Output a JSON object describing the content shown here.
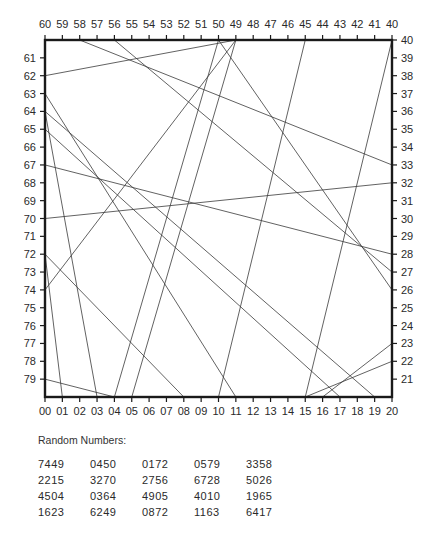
{
  "figure": {
    "frame": {
      "x0": 45,
      "y0": 40,
      "x1": 392,
      "y1": 397
    },
    "colors": {
      "frame": "#1a1a1a",
      "segments": "#3a3a3a",
      "text": "#2a2a2a"
    },
    "top_labels": [
      "60",
      "59",
      "58",
      "57",
      "56",
      "55",
      "54",
      "53",
      "52",
      "51",
      "50",
      "49",
      "48",
      "47",
      "46",
      "45",
      "44",
      "43",
      "42",
      "41",
      "40"
    ],
    "bottom_labels": [
      "00",
      "01",
      "02",
      "03",
      "04",
      "05",
      "06",
      "07",
      "08",
      "09",
      "10",
      "11",
      "12",
      "13",
      "14",
      "15",
      "16",
      "17",
      "18",
      "19",
      "20"
    ],
    "left_labels": [
      "61",
      "62",
      "63",
      "64",
      "65",
      "66",
      "67",
      "68",
      "69",
      "70",
      "71",
      "72",
      "73",
      "74",
      "75",
      "76",
      "77",
      "78",
      "79"
    ],
    "right_labels": [
      "40",
      "39",
      "38",
      "37",
      "36",
      "35",
      "34",
      "33",
      "32",
      "31",
      "30",
      "29",
      "28",
      "27",
      "26",
      "25",
      "24",
      "23",
      "22",
      "21"
    ],
    "segments": [
      {
        "from": "58",
        "to": "33"
      },
      {
        "from": "56",
        "to": "27"
      },
      {
        "from": "62",
        "to": "49"
      },
      {
        "from": "50",
        "to": "04"
      },
      {
        "from": "49",
        "to": "05"
      },
      {
        "from": "50",
        "to": "26"
      },
      {
        "from": "45",
        "to": "10"
      },
      {
        "from": "40",
        "to": "15"
      },
      {
        "from": "63",
        "to": "11"
      },
      {
        "from": "64",
        "to": "03"
      },
      {
        "from": "64",
        "to": "19"
      },
      {
        "from": "65",
        "to": "17"
      },
      {
        "from": "67",
        "to": "28"
      },
      {
        "from": "70",
        "to": "32"
      },
      {
        "from": "74",
        "to": "49"
      },
      {
        "from": "72",
        "to": "08"
      },
      {
        "from": "72",
        "to": "01"
      },
      {
        "from": "79",
        "to": "04"
      },
      {
        "from": "16",
        "to": "23"
      },
      {
        "from": "15",
        "to": "22"
      }
    ]
  },
  "random_numbers": {
    "title": "Random Numbers:",
    "rows": [
      [
        "7449",
        "0450",
        "0172",
        "0579",
        "3358"
      ],
      [
        "2215",
        "3270",
        "2756",
        "6728",
        "5026"
      ],
      [
        "4504",
        "0364",
        "4905",
        "4010",
        "1965"
      ],
      [
        "1623",
        "6249",
        "0872",
        "1163",
        "6417"
      ]
    ]
  }
}
